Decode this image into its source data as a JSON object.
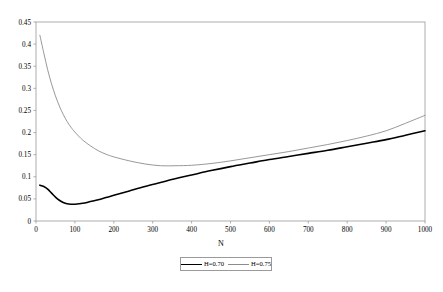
{
  "chart_data": {
    "type": "line",
    "title": "",
    "xlabel": "N",
    "ylabel": "",
    "xlim": [
      0,
      1000
    ],
    "ylim": [
      0,
      0.45
    ],
    "grid": false,
    "legend_position": "bottom-center",
    "x_ticks": [
      "0",
      "100",
      "200",
      "300",
      "400",
      "500",
      "600",
      "700",
      "800",
      "900",
      "1000"
    ],
    "x_tick_values": [
      0,
      100,
      200,
      300,
      400,
      500,
      600,
      700,
      800,
      900,
      1000
    ],
    "y_ticks": [
      "0",
      "0.05",
      "0.1",
      "0.15",
      "0.2",
      "0.25",
      "0.3",
      "0.35",
      "0.4",
      "0.45"
    ],
    "y_tick_values": [
      0,
      0.05,
      0.1,
      0.15,
      0.2,
      0.25,
      0.3,
      0.35,
      0.4,
      0.45
    ],
    "x": [
      10,
      20,
      30,
      40,
      50,
      60,
      70,
      80,
      90,
      100,
      120,
      140,
      160,
      180,
      200,
      240,
      280,
      320,
      360,
      400,
      450,
      500,
      550,
      600,
      650,
      700,
      750,
      800,
      850,
      900,
      950,
      1000
    ],
    "series": [
      {
        "name": "H=0.70",
        "color": "#000000",
        "width": 1.6,
        "values": [
          0.081,
          0.078,
          0.072,
          0.063,
          0.054,
          0.047,
          0.042,
          0.039,
          0.038,
          0.038,
          0.04,
          0.044,
          0.048,
          0.053,
          0.058,
          0.068,
          0.078,
          0.087,
          0.096,
          0.104,
          0.114,
          0.123,
          0.131,
          0.139,
          0.146,
          0.153,
          0.16,
          0.168,
          0.176,
          0.184,
          0.194,
          0.204
        ]
      },
      {
        "name": "H=0.75",
        "color": "#8c8c8c",
        "width": 0.9,
        "values": [
          0.42,
          0.38,
          0.342,
          0.31,
          0.283,
          0.26,
          0.241,
          0.225,
          0.212,
          0.201,
          0.183,
          0.17,
          0.159,
          0.151,
          0.145,
          0.136,
          0.129,
          0.125,
          0.125,
          0.126,
          0.13,
          0.136,
          0.143,
          0.15,
          0.157,
          0.165,
          0.173,
          0.182,
          0.192,
          0.204,
          0.221,
          0.239
        ]
      }
    ],
    "legend": [
      {
        "label": "H=0.70"
      },
      {
        "label": "H=0.75"
      }
    ]
  },
  "frame": {
    "left": 36,
    "right": 425,
    "top": 22,
    "bottom": 221,
    "border_color": "#9a9a9a"
  }
}
